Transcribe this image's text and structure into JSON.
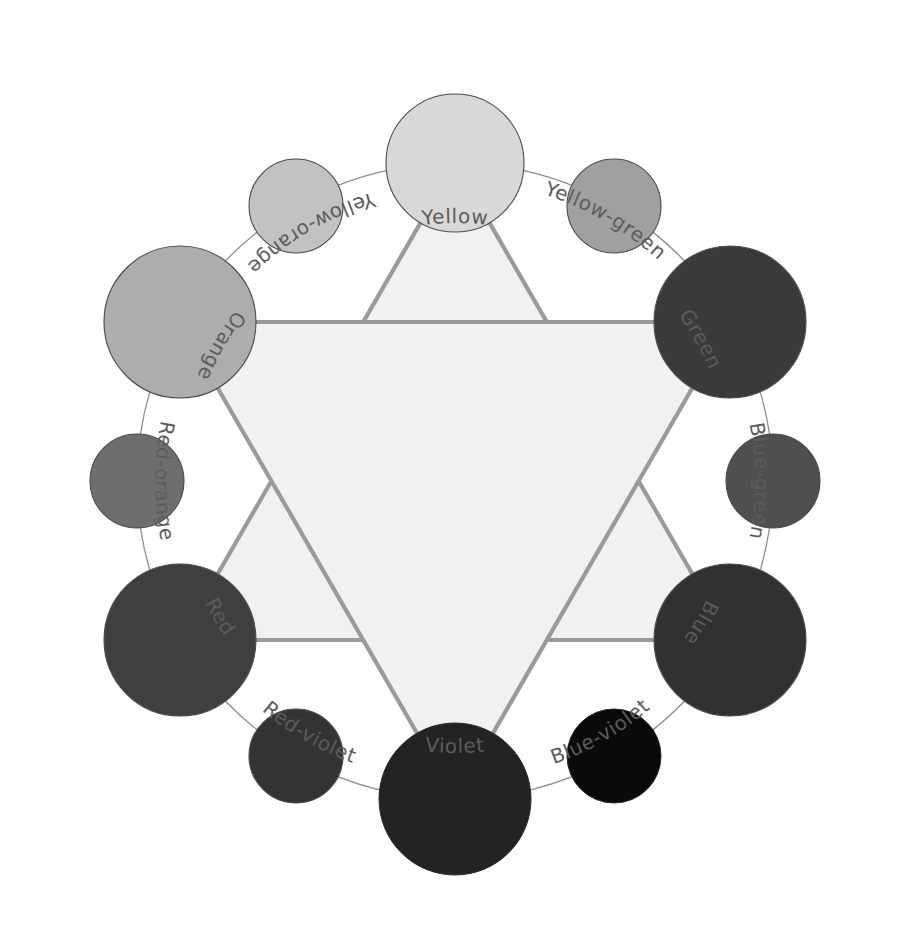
{
  "figure": {
    "type": "color-wheel-diagram",
    "background_color": "#ffffff",
    "rendering": "grayscale",
    "center_x": 455,
    "center_y": 481,
    "ring_radius": 318,
    "ring_stroke_color": "#8d8d8d",
    "label_color": "#5c5c5c",
    "label_font_size": 20
  },
  "triangles": {
    "fill_color": "#f1f1f1",
    "stroke_color": "#9a9a9a",
    "stroke_width": 4.2,
    "primary_triangle": {
      "name": "primary-triangle",
      "vertices": [
        "Yellow",
        "Red",
        "Blue"
      ],
      "vertex_angles_deg": [
        0,
        240,
        120
      ]
    },
    "secondary_triangle": {
      "name": "secondary-triangle",
      "vertices": [
        "Green",
        "Violet",
        "Orange"
      ],
      "vertex_angles_deg": [
        60,
        180,
        300
      ]
    }
  },
  "hues": [
    {
      "label": "Yellow",
      "category": "primary",
      "angle_deg": 0,
      "color": "#d8d8d8",
      "radius": 69,
      "cx": 455,
      "cy": 163,
      "label_radius": 258,
      "label_flip": false
    },
    {
      "label": "Yellow-green",
      "category": "tertiary",
      "angle_deg": 30,
      "color": "#a0a0a0",
      "radius": 47,
      "cx": 614,
      "cy": 206,
      "label_radius": 300,
      "label_flip": false
    },
    {
      "label": "Green",
      "category": "secondary",
      "angle_deg": 60,
      "color": "#3a3a3a",
      "radius": 76,
      "cx": 730,
      "cy": 322,
      "label_radius": 278,
      "label_flip": false
    },
    {
      "label": "Blue-green",
      "category": "tertiary",
      "angle_deg": 90,
      "color": "#4f4f4f",
      "radius": 47,
      "cx": 773,
      "cy": 481,
      "label_radius": 300,
      "label_flip": false
    },
    {
      "label": "Blue",
      "category": "primary",
      "angle_deg": 120,
      "color": "#313131",
      "radius": 76,
      "cx": 730,
      "cy": 640,
      "label_radius": 278,
      "label_flip": false
    },
    {
      "label": "Blue-violet",
      "category": "tertiary",
      "angle_deg": 150,
      "color": "#0a0a0a",
      "radius": 47,
      "cx": 614,
      "cy": 756,
      "label_radius": 300,
      "label_flip": true
    },
    {
      "label": "Violet",
      "category": "secondary",
      "angle_deg": 180,
      "color": "#232323",
      "radius": 76,
      "cx": 455,
      "cy": 799,
      "label_radius": 272,
      "label_flip": true
    },
    {
      "label": "Red-violet",
      "category": "tertiary",
      "angle_deg": 210,
      "color": "#333333",
      "radius": 47,
      "cx": 296,
      "cy": 756,
      "label_radius": 300,
      "label_flip": true
    },
    {
      "label": "Red",
      "category": "primary",
      "angle_deg": 240,
      "color": "#3f3f3f",
      "radius": 76,
      "cx": 180,
      "cy": 640,
      "label_radius": 278,
      "label_flip": true
    },
    {
      "label": "Red-orange",
      "category": "tertiary",
      "angle_deg": 270,
      "color": "#6e6e6e",
      "radius": 47,
      "cx": 137,
      "cy": 481,
      "label_radius": 300,
      "label_flip": true
    },
    {
      "label": "Orange",
      "category": "secondary",
      "angle_deg": 300,
      "color": "#adadad",
      "radius": 76,
      "cx": 180,
      "cy": 322,
      "label_radius": 278,
      "label_flip": true
    },
    {
      "label": "Yellow-orange",
      "category": "tertiary",
      "angle_deg": 330,
      "color": "#c2c2c2",
      "radius": 47,
      "cx": 296,
      "cy": 206,
      "label_radius": 300,
      "label_flip": true
    }
  ],
  "chart_data": {
    "type": "pie",
    "categories": [
      "Yellow",
      "Yellow-green",
      "Green",
      "Blue-green",
      "Blue",
      "Blue-violet",
      "Violet",
      "Red-violet",
      "Red",
      "Red-orange",
      "Orange",
      "Yellow-orange"
    ],
    "values": [
      30,
      30,
      60,
      30,
      60,
      30,
      60,
      30,
      60,
      30,
      60,
      30
    ],
    "series": [
      {
        "name": "swatch-diameter-px",
        "values": [
          138,
          94,
          152,
          94,
          152,
          94,
          152,
          94,
          152,
          94,
          152,
          94
        ]
      },
      {
        "name": "grayscale-value",
        "values": [
          216,
          160,
          58,
          79,
          49,
          10,
          35,
          51,
          63,
          110,
          173,
          194
        ]
      },
      {
        "name": "angle-degrees-from-top",
        "values": [
          0,
          30,
          60,
          90,
          120,
          150,
          180,
          210,
          240,
          270,
          300,
          330
        ]
      }
    ],
    "colors": [
      "#d8d8d8",
      "#a0a0a0",
      "#3a3a3a",
      "#4f4f4f",
      "#313131",
      "#0a0a0a",
      "#232323",
      "#333333",
      "#3f3f3f",
      "#6e6e6e",
      "#adadad",
      "#c2c2c2"
    ],
    "xlabel": "",
    "ylabel": "",
    "legend": "none",
    "grid": false,
    "annotations": [
      "Primary hues: Yellow, Red, Blue",
      "Secondary hues: Orange, Green, Violet",
      "Tertiary hues: Yellow-orange, Yellow-green, Blue-green, Blue-violet, Red-violet, Red-orange"
    ]
  }
}
